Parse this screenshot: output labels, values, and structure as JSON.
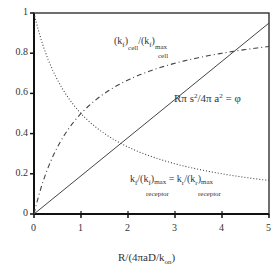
{
  "chart_data": {
    "type": "line",
    "title": "",
    "xlabel": "R/(4πaD/k_on)",
    "ylabel": "",
    "xlim": [
      0,
      5
    ],
    "ylim": [
      0,
      1
    ],
    "grid": false,
    "x_ticks": [
      "0",
      "1",
      "2",
      "3",
      "4",
      "5"
    ],
    "y_ticks": [
      "0",
      "0.2",
      "0.4",
      "0.6",
      "0.8",
      "1"
    ],
    "series": [
      {
        "name": "(k_f)_cell/(k_f)_max,cell",
        "style": "dash-dot",
        "x": [
          0,
          0.25,
          0.5,
          1,
          1.5,
          2,
          2.5,
          3,
          3.5,
          4,
          4.5,
          5
        ],
        "values": [
          0,
          0.2,
          0.333,
          0.5,
          0.6,
          0.667,
          0.714,
          0.75,
          0.778,
          0.8,
          0.818,
          0.833
        ]
      },
      {
        "name": "k_f/(k_f)_max,receptor = k_r/(k_r)_max,receptor",
        "style": "dotted",
        "x": [
          0,
          0.25,
          0.5,
          1,
          1.5,
          2,
          2.5,
          3,
          3.5,
          4,
          4.5,
          5
        ],
        "values": [
          1,
          0.8,
          0.667,
          0.5,
          0.4,
          0.333,
          0.286,
          0.25,
          0.222,
          0.2,
          0.182,
          0.167
        ]
      },
      {
        "name": "Rπs²/4πa² = φ",
        "style": "solid",
        "x": [
          0,
          5
        ],
        "values": [
          0,
          0.95
        ]
      }
    ],
    "annotations": [
      "(k_f)_cell/(k_f)_max cell",
      "Rπ s²/4π a² = φ",
      "k_f/(k_f)_max receptor = k_r/(k_r)_max receptor"
    ]
  },
  "labels": {
    "xlabel_main": "R/(4πaD/k",
    "xlabel_sub": "on",
    "xlabel_close": ")",
    "cell_k1": "(k",
    "cell_f1": "f",
    "cell_close1": ")",
    "cell_sub": "cell",
    "cell_div": "/(k",
    "cell_f2": "f",
    "cell_close2": ")",
    "cell_max": "max",
    "cell_sub2": "cell",
    "phi_text": "Rπ s",
    "phi_sup": "2",
    "phi_mid": "/4π a",
    "phi_sup2": "2",
    "phi_end": " = φ",
    "rec_k": "k",
    "rec_f": "f",
    "rec_div": "/(k",
    "rec_f2": "f",
    "rec_close": ")",
    "rec_max": "max",
    "rec_sub": "receptor",
    "rec_eq": " = k",
    "rec_r": "r",
    "rec_div2": "/(k",
    "rec_r2": "r",
    "rec_close2": ")",
    "rec_max2": "max",
    "rec_sub2": "receptor"
  }
}
